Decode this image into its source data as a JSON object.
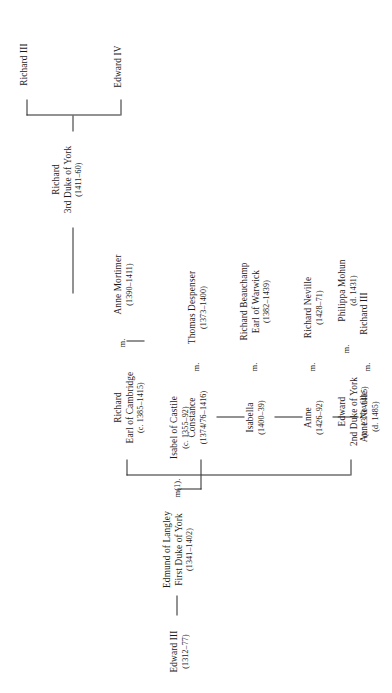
{
  "document": {
    "type": "genealogical-family-tree",
    "orientation": "rotated-90-counterclockwise",
    "title": "House of York descent chart"
  },
  "marriage_markers": {
    "m1": "m(1).",
    "m": "m."
  },
  "people": {
    "edward_iii": {
      "name": "Edward III",
      "name2": "",
      "dates": "(1312–77)"
    },
    "edmund_langley": {
      "name": "Edmund of Langley",
      "name2": "First Duke of York",
      "dates": "(1341–1402)"
    },
    "isabel_castile": {
      "name": "Isabel of Castile",
      "name2": "",
      "dates": "(c. 1355–92)"
    },
    "constance": {
      "name": "Constance",
      "name2": "",
      "dates": "(1374/76–1416)"
    },
    "thomas_despenser": {
      "name": "Thomas Despenser",
      "name2": "",
      "dates": "(1373–1400)"
    },
    "richard_cambridge": {
      "name": "Richard",
      "name2": "Earl of Cambridge",
      "dates": "(c. 1385–1415)"
    },
    "anne_mortimer": {
      "name": "Anne Mortimer",
      "name2": "",
      "dates": "(1390–1411)"
    },
    "edward_2nd_york": {
      "name": "Edward",
      "name2": "2nd Duke of York",
      "dates": "(c. 1373–1415)"
    },
    "philippa_mohun": {
      "name": "Philippa Mohun",
      "name2": "",
      "dates": "(d. 1431)"
    },
    "isabella": {
      "name": "Isabella",
      "name2": "",
      "dates": "(1400–39)"
    },
    "richard_beauchamp": {
      "name": "Richard Beauchamp",
      "name2": "Earl of Warwick",
      "dates": "(1382–1439)"
    },
    "anne": {
      "name": "Anne",
      "name2": "",
      "dates": "(1426–92)"
    },
    "richard_neville": {
      "name": "Richard Neville",
      "name2": "",
      "dates": "(1428–71)"
    },
    "anne_neville": {
      "name": "Anne Neville",
      "name2": "",
      "dates": "(d. 1485)"
    },
    "richard_iii_sp": {
      "name": "Richard III",
      "name2": "",
      "dates": ""
    },
    "richard_3rd_york": {
      "name": "Richard",
      "name2": "3rd Duke of York",
      "dates": "(1411–60)"
    },
    "edward_iv": {
      "name": "Edward IV",
      "name2": "",
      "dates": ""
    },
    "richard_iii": {
      "name": "Richard III",
      "name2": "",
      "dates": ""
    }
  },
  "colors": {
    "ink": "#1a1a1a",
    "rule": "#262626",
    "paper": "#ffffff"
  }
}
